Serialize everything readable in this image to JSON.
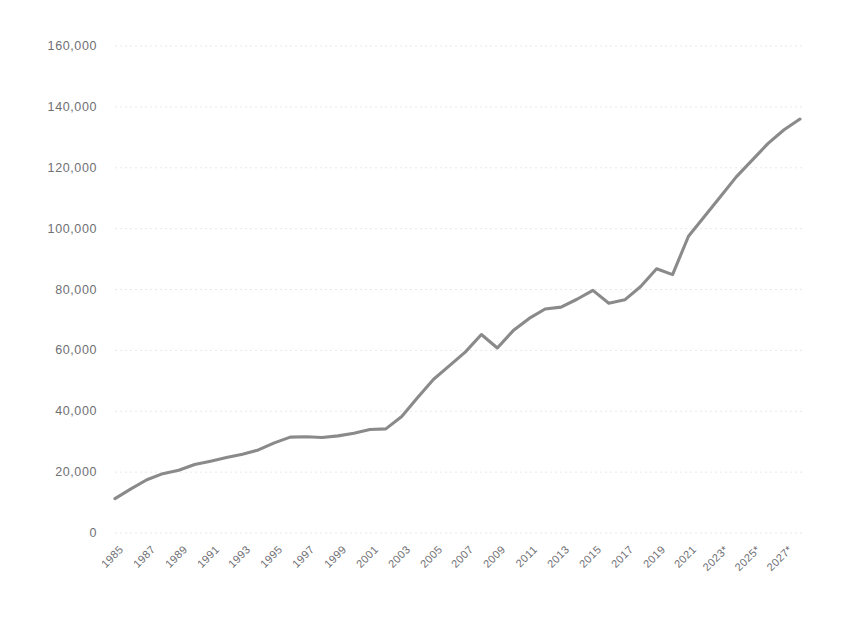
{
  "title": {
    "text": "",
    "visible": false,
    "note": "title-cropped-at-top-edge"
  },
  "chart_data": {
    "type": "line",
    "title": "",
    "xlabel": "",
    "ylabel": "",
    "ylim": [
      0,
      160000
    ],
    "xlim": [
      1985,
      2028
    ],
    "grid": "horizontal-dotted",
    "legend": "none",
    "line_color": "#8a8a8a",
    "background": "#ffffff",
    "y_ticks": [
      0,
      20000,
      40000,
      60000,
      80000,
      100000,
      120000,
      140000,
      160000
    ],
    "y_tick_labels": [
      "0",
      "20,000",
      "40,000",
      "60,000",
      "80,000",
      "100,000",
      "120,000",
      "140,000",
      "160,000"
    ],
    "x_tick_labels": [
      "1985",
      "1987",
      "1989",
      "1991",
      "1993",
      "1995",
      "1997",
      "1999",
      "2001",
      "2003",
      "2005",
      "2007",
      "2009",
      "2011",
      "2013",
      "2015",
      "2017",
      "2019",
      "2021",
      "2023*",
      "2025*",
      "2027*"
    ],
    "x_tick_values": [
      1985,
      1987,
      1989,
      1991,
      1993,
      1995,
      1997,
      1999,
      2001,
      2003,
      2005,
      2007,
      2009,
      2011,
      2013,
      2015,
      2017,
      2019,
      2021,
      2023,
      2025,
      2027
    ],
    "x": [
      1985,
      1986,
      1987,
      1988,
      1989,
      1990,
      1991,
      1992,
      1993,
      1994,
      1995,
      1996,
      1997,
      1998,
      1999,
      2000,
      2001,
      2002,
      2003,
      2004,
      2005,
      2006,
      2007,
      2008,
      2009,
      2010,
      2011,
      2012,
      2013,
      2014,
      2015,
      2016,
      2017,
      2018,
      2019,
      2020,
      2021,
      2022,
      2023,
      2024,
      2025,
      2026,
      2027,
      2028
    ],
    "values": [
      11300,
      14500,
      17500,
      19500,
      20600,
      22500,
      23600,
      24800,
      25900,
      27300,
      29600,
      31500,
      31600,
      31400,
      31900,
      32800,
      34000,
      34200,
      38300,
      44500,
      50500,
      55000,
      59500,
      65200,
      60800,
      66500,
      70500,
      73600,
      74200,
      76800,
      79700,
      75500,
      76600,
      81000,
      86800,
      84900,
      97500,
      104000,
      110500,
      117000,
      122500,
      128000,
      132500,
      136000
    ],
    "annotations": [
      {
        "label": "forecast-years",
        "values": [
          "2023*",
          "2025*",
          "2027*"
        ]
      }
    ]
  },
  "axis": {
    "y_axis_name": "y-axis",
    "x_axis_name": "x-axis"
  }
}
